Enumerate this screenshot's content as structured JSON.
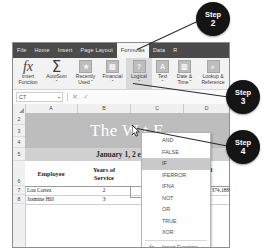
{
  "app": {
    "name": "Microsoft Excel",
    "ribbon_tabs": [
      {
        "label": "File",
        "active": false
      },
      {
        "label": "Home",
        "active": false
      },
      {
        "label": "Insert",
        "active": false
      },
      {
        "label": "Page Layout",
        "active": false
      },
      {
        "label": "Formulas",
        "active": true
      },
      {
        "label": "Data",
        "active": false
      },
      {
        "label": "R",
        "active": false
      }
    ],
    "ribbon_groups": [
      {
        "icon": "fx-icon",
        "glyph": "fx",
        "line1": "Insert",
        "line2": "Function",
        "highlighted": false
      },
      {
        "icon": "autosum-icon",
        "glyph": "Σ",
        "line1": "AutoSum",
        "line2": "ˇ",
        "highlighted": false
      },
      {
        "icon": "recently-used-icon",
        "glyph": "★",
        "line1": "Recently",
        "line2": "Used ˇ",
        "highlighted": false
      },
      {
        "icon": "financial-icon",
        "glyph": "▤",
        "line1": "Financial",
        "line2": "ˇ",
        "highlighted": false
      },
      {
        "icon": "logical-icon",
        "glyph": "?",
        "line1": "Logical",
        "line2": "ˇ",
        "highlighted": true
      },
      {
        "icon": "text-icon",
        "glyph": "A",
        "line1": "Text",
        "line2": "ˇ",
        "highlighted": false
      },
      {
        "icon": "date-time-icon",
        "glyph": "▥",
        "line1": "Date &",
        "line2": "Time ˇ",
        "highlighted": false
      },
      {
        "icon": "lookup-reference-icon",
        "glyph": "⌕",
        "line1": "Lookup &",
        "line2": "Reference",
        "highlighted": false
      }
    ],
    "formula_bar": {
      "name_box_value": "C7",
      "name_box_arrow": "▾",
      "cancel_label": "✕",
      "enter_label": "✓",
      "formula_value": ""
    }
  },
  "dropdown": {
    "name": "logical-function-menu",
    "items": [
      {
        "label": "AND",
        "selected": false
      },
      {
        "label": "FALSE",
        "selected": false
      },
      {
        "label": "IF",
        "selected": true
      },
      {
        "label": "IFERROR",
        "selected": false
      },
      {
        "label": "IFNA",
        "selected": false
      },
      {
        "label": "NOT",
        "selected": false
      },
      {
        "label": "OR",
        "selected": false
      },
      {
        "label": "TRUE",
        "selected": false
      },
      {
        "label": "XOR",
        "selected": false
      }
    ],
    "insert_function": {
      "glyph": "fx",
      "label": "Insert Function..."
    }
  },
  "sheet": {
    "column_headers": [
      "A",
      "B",
      "C",
      "D"
    ],
    "row_numbers": [
      "2",
      "3",
      "4",
      "5",
      "6",
      "7",
      "8"
    ],
    "title": "The W                    t E",
    "subtitle": "January 1, 2                    ember",
    "header_row": [
      {
        "label": "Employee"
      },
      {
        "label": "Years of\nService"
      },
      {
        "label": "End\nofit"
      }
    ],
    "rows": [
      {
        "num": "7",
        "employee": "Lou Cortez",
        "years": "2",
        "currency": "$",
        "amount": "374,188"
      },
      {
        "num": "8",
        "employee": "Jasmine Hill",
        "years": "3",
        "currency": "",
        "amount": ""
      }
    ]
  },
  "callouts": [
    {
      "id": "step2",
      "word": "Step",
      "number": "2"
    },
    {
      "id": "step3",
      "word": "Step",
      "number": "3"
    },
    {
      "id": "step4",
      "word": "Step",
      "number": "4"
    }
  ],
  "colors": {
    "tab_strip": "#4b4b4b",
    "active_tab": "#f4f4f4",
    "callout_bg": "#141414",
    "title_band": "#bdbdbd",
    "menu_selected": "#c9c9c9"
  }
}
